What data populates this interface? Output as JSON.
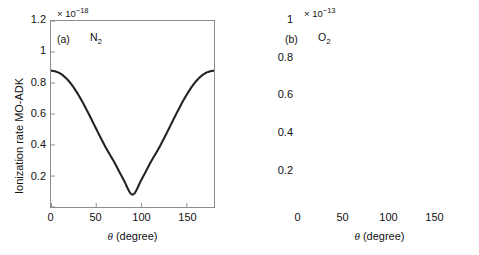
{
  "figure": {
    "background": "#ffffff",
    "curve_color": "#222222",
    "axis_color": "#8d8d8d"
  },
  "panels": [
    {
      "key": "a",
      "tag": "(a)",
      "species_main": "N",
      "species_sub": "2",
      "multiplier_prefix": "× 10",
      "multiplier_exponent": "−18",
      "ylabel": "Ionization rate MO-ADK",
      "xlabel_symbol": "θ",
      "xlabel_unit": "(degree)",
      "yticks": [
        "1.2",
        "1",
        "0.8",
        "0.6",
        "0.4",
        "0.2"
      ],
      "xticks": [
        "0",
        "50",
        "100",
        "150"
      ]
    },
    {
      "key": "b",
      "tag": "(b)",
      "species_main": "O",
      "species_sub": "2",
      "multiplier_prefix": "× 10",
      "multiplier_exponent": "−13",
      "ylabel": "Ionization rate MO-ADK",
      "xlabel_symbol": "θ",
      "xlabel_unit": "(degree)",
      "yticks": [
        "1",
        "0.8",
        "0.6",
        "0.4",
        "0.2"
      ],
      "xticks": [
        "0",
        "50",
        "100",
        "150"
      ]
    }
  ],
  "chart_data": [
    {
      "type": "line",
      "panel": "(a)",
      "title": "N2",
      "xlabel": "θ (degree)",
      "ylabel": "Ionization rate MO-ADK",
      "y_multiplier": "×10^-18",
      "xlim": [
        0,
        180
      ],
      "ylim": [
        0,
        1.2
      ],
      "xticks": [
        0,
        50,
        100,
        150
      ],
      "yticks": [
        0.2,
        0.4,
        0.6,
        0.8,
        1,
        1.2
      ],
      "grid": false,
      "legend": "none",
      "x": [
        0,
        10,
        20,
        30,
        40,
        50,
        60,
        70,
        80,
        90,
        100,
        110,
        120,
        130,
        140,
        150,
        160,
        170,
        180
      ],
      "y": [
        0.88,
        0.862,
        0.81,
        0.726,
        0.62,
        0.503,
        0.389,
        0.288,
        0.178,
        0.08,
        0.178,
        0.288,
        0.389,
        0.503,
        0.62,
        0.726,
        0.81,
        0.862,
        0.88
      ]
    },
    {
      "type": "line",
      "panel": "(b)",
      "title": "O2",
      "xlabel": "θ (degree)",
      "ylabel": "Ionization rate MO-ADK",
      "y_multiplier": "×10^-13",
      "xlim": [
        0,
        180
      ],
      "ylim": [
        0,
        1.0
      ],
      "xticks": [
        0,
        50,
        100,
        150
      ],
      "yticks": [
        0.2,
        0.4,
        0.6,
        0.8,
        1
      ],
      "grid": false,
      "legend": "none",
      "x": [
        0,
        10,
        20,
        30,
        40,
        50,
        60,
        70,
        80,
        90,
        100,
        110,
        120,
        130,
        140,
        150,
        160,
        170,
        180
      ],
      "y": [
        0.09,
        0.165,
        0.39,
        0.68,
        0.85,
        0.81,
        0.62,
        0.38,
        0.15,
        0.02,
        0.15,
        0.38,
        0.62,
        0.81,
        0.85,
        0.68,
        0.39,
        0.165,
        0.09
      ]
    }
  ]
}
